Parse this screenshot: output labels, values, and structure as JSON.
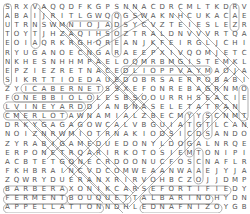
{
  "puzzle": {
    "type": "word-search",
    "rows": 23,
    "cols": 27,
    "grid": [
      "SRXVAQQDFKGPSNNACDRCMLTKDRV",
      "ABAIJRITLGWQQGSWAKNHCUKACAE",
      "UTRNSWMNIOJADSYCVZTEIESLEZR",
      "TOYTJHZAQIHSOZTRALDNVVVRTQAD",
      "EOIAQRKRGHQREANJKFEIRGLJCHI",
      "RYUGANOECNGARAEEPXIVQOMJETC",
      "NKHESNHHMPAELOQMRBMGISTEMKLC",
      "EPZIEZRETNACEDLIOPPVAYMAOJAH",
      "SIKRTTIOEDAUEDOBRSAERPOBABI",
      "ZYICABERNETSSXEFONREBAGRNMO",
      "FONEBBIOLOLESBSOOURRHSEACIE",
      "LVINEYARDDIANBNASELETATPAN",
      "CMERLOTAWNAMIALZBECMYYSCNMT",
      "DRKYGAGAGOWCALVBGUIATGTLCAN",
      "NOIZNRWMIOTRNAKIODSICDSANDO",
      "ZYRABIGAMEDUEDONYLDOGALNRQEM",
      "ERPONETRQARIRKOTOSIEMTONIPID",
      "ACBTETGONECRDOONUCFOSCNAFLRE",
      "FKHBRAINCVDCOMWEAANWAAEJYJAI",
      "ZQWRYDUERANXRIRVOHBCZOJJDMP",
      "BARBERAXONIKCARSEFORTIFIEDY",
      "FERMENTBOUQUETTALBARINOHYDN",
      "APPELLATIONNDHLEDNAFNIZOYGB"
    ],
    "found_words": [
      "SAUTERNES",
      "CABERNET",
      "NEBBIOLO",
      "VINEYARD",
      "MERLOT",
      "BARBERA",
      "FERMENT",
      "BOUQUET",
      "ALBARINO",
      "APPELLATION",
      "FORTIFIED",
      "ZINFANDEL",
      "TANNIN",
      "CARAFE",
      "NAPA",
      "ACIDIC",
      "OAKED",
      "MALBEC",
      "SYRAH",
      "DRY",
      "BRUT",
      "SIP"
    ],
    "colors": {
      "letter": "#555555",
      "circle": "#999999",
      "background": "#ffffff"
    }
  }
}
